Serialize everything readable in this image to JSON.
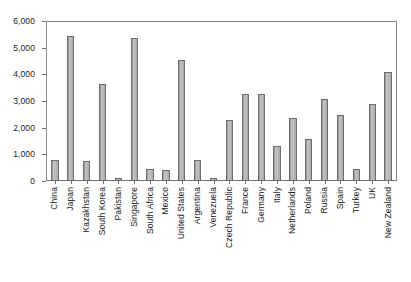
{
  "chart_data": {
    "type": "bar",
    "title": "",
    "xlabel": "",
    "ylabel": "",
    "ylim": [
      0,
      6000
    ],
    "ytick_labels": [
      "6,000",
      "5,000",
      "4,000",
      "3,000",
      "2,000",
      "1,000",
      "0"
    ],
    "ytick_values": [
      6000,
      5000,
      4000,
      3000,
      2000,
      1000,
      0
    ],
    "grid": false,
    "legend": "none",
    "categories": [
      "China",
      "Japan",
      "Kazakhstan",
      "South Korea",
      "Pakistan",
      "Singapore",
      "South Africa",
      "Mexico",
      "United States",
      "Argentina",
      "Venezuela",
      "Czech Republic",
      "France",
      "Germany",
      "Italy",
      "Netherlands",
      "Poland",
      "Russia",
      "Spain",
      "Turkey",
      "UK",
      "New Zealand"
    ],
    "values": [
      800,
      5450,
      760,
      3650,
      110,
      5350,
      450,
      400,
      4550,
      790,
      100,
      2270,
      3270,
      3270,
      1330,
      2360,
      1560,
      3070,
      2460,
      450,
      2900,
      4100
    ],
    "bar_color": "#b5b5b5",
    "bar_border_color": "#6e6e6e",
    "axis_color": "#6f6f6f",
    "text_color": "#1a1a1a"
  }
}
